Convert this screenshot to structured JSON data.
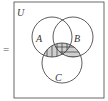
{
  "diagram": {
    "prefix_symbol": "=",
    "universe_label": "U",
    "sets": [
      {
        "label": "A",
        "cx": 52,
        "cy": 37,
        "r": 20
      },
      {
        "label": "B",
        "cx": 73,
        "cy": 37,
        "r": 20
      },
      {
        "label": "C",
        "cx": 62,
        "cy": 63,
        "r": 20
      }
    ],
    "shaded_region": "(A ∪ B) ∩ C",
    "hatching": {
      "A∩C": "vertical",
      "B∩C": "horizontal"
    },
    "colors": {
      "stroke": "#333333",
      "fill": "#cfcfcf",
      "background": "#ffffff"
    }
  }
}
